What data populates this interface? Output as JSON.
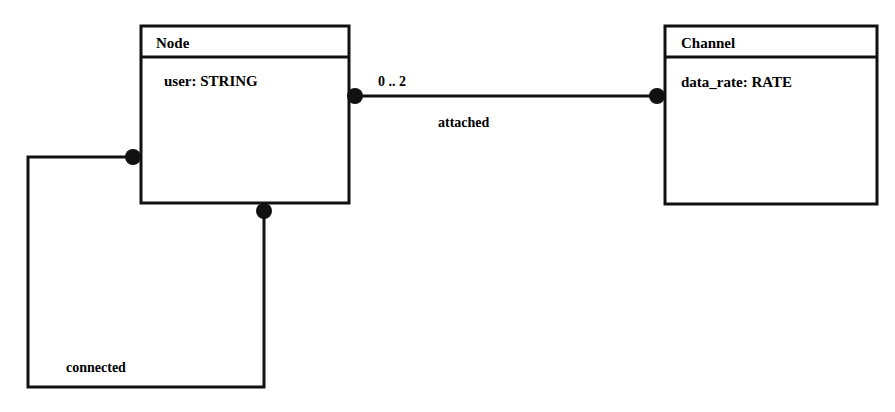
{
  "diagram": {
    "type": "class/entity diagram",
    "classes": [
      {
        "id": "node",
        "name": "Node",
        "attributes": [
          "user: STRING"
        ]
      },
      {
        "id": "channel",
        "name": "Channel",
        "attributes": [
          "data_rate: RATE"
        ]
      }
    ],
    "associations": [
      {
        "id": "attached",
        "label": "attached",
        "from": "Node",
        "to": "Channel",
        "multiplicity_from": "0 .. 2"
      },
      {
        "id": "connected",
        "label": "connected",
        "from": "Node",
        "to": "Node"
      }
    ]
  },
  "colors": {
    "line": "#111111",
    "background": "#ffffff"
  }
}
